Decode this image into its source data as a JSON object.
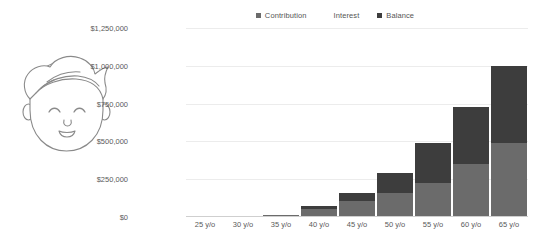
{
  "illustration": {
    "name": "smiling-child-face-line-art",
    "stroke_color": "#8a8a8a"
  },
  "legend": [
    {
      "label": "Contribution",
      "color": "#6b6b6b",
      "marker": "square",
      "marker_visible": true
    },
    {
      "label": "Interest",
      "color": "#3d3d3d",
      "marker": "square",
      "marker_visible": false
    },
    {
      "label": "Balance",
      "color": "#3d3d3d",
      "marker": "square",
      "marker_visible": true
    }
  ],
  "colors": {
    "contribution": "#6b6b6b",
    "interest": "#3d3d3d",
    "gridline": "#ececec",
    "axis_text": "#5a5a5a",
    "legend_text": "#555555",
    "background": "#ffffff"
  },
  "chart_data": {
    "type": "bar",
    "stacked": true,
    "title": "",
    "subtitle": "",
    "xlabel": "",
    "ylabel": "",
    "categories": [
      "25 y/o",
      "30 y/o",
      "35 y/o",
      "40 y/o",
      "45 y/o",
      "50 y/o",
      "55 y/o",
      "60 y/o",
      "65 y/o"
    ],
    "series": [
      {
        "name": "Contribution",
        "color": "#6b6b6b",
        "values": [
          0,
          0,
          12000,
          50000,
          105000,
          160000,
          225000,
          350000,
          490000
        ]
      },
      {
        "name": "Interest",
        "color": "#3d3d3d",
        "values": [
          0,
          0,
          3000,
          25000,
          55000,
          130000,
          265000,
          375000,
          510000
        ]
      }
    ],
    "totals": [
      0,
      0,
      15000,
      75000,
      160000,
      290000,
      490000,
      725000,
      1000000
    ],
    "ylim": [
      0,
      1250000
    ],
    "ytick_values": [
      0,
      250000,
      500000,
      750000,
      1000000,
      1250000
    ],
    "ytick_labels": [
      "$0",
      "$250,000",
      "$500,000",
      "$750,000",
      "$1,000,000",
      "$1,250,000"
    ],
    "grid": true,
    "grid_axis": "y",
    "legend_position": "top-center"
  }
}
